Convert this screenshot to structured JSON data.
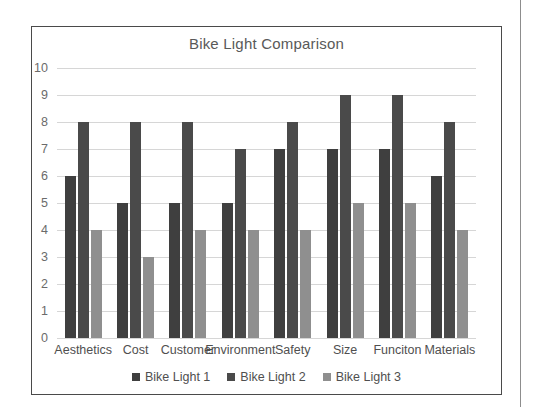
{
  "chart_data": {
    "type": "bar",
    "title": "Bike Light Comparison",
    "xlabel": "",
    "ylabel": "",
    "ylim": [
      0,
      10
    ],
    "ytick_step": 1,
    "yticks": [
      "10",
      "9",
      "8",
      "7",
      "6",
      "5",
      "4",
      "3",
      "2",
      "1",
      "0"
    ],
    "grid": true,
    "legend_position": "bottom",
    "categories": [
      "Aesthetics",
      "Cost",
      "Customer",
      "Environment",
      "Safety",
      "Size",
      "Funciton",
      "Materials"
    ],
    "series": [
      {
        "name": "Bike Light 1",
        "color": "#3f3f3f",
        "values": [
          6,
          5,
          5,
          5,
          7,
          7,
          7,
          6
        ]
      },
      {
        "name": "Bike Light 2",
        "color": "#4a4a4a",
        "values": [
          8,
          8,
          8,
          7,
          8,
          9,
          9,
          8
        ]
      },
      {
        "name": "Bike Light 3",
        "color": "#8f8f8f",
        "values": [
          4,
          3,
          4,
          4,
          4,
          5,
          5,
          4
        ]
      }
    ]
  },
  "frame": {
    "border_color": "#4a4a4a",
    "background": "#ffffff"
  },
  "gridline_color": "#d6d6d6",
  "page_edge_color": "#8d8d8d"
}
